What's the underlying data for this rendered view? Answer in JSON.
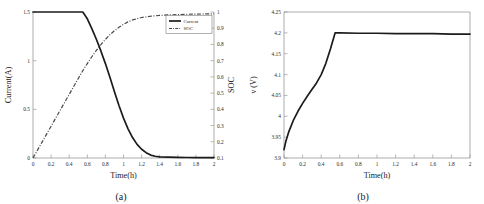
{
  "figure": {
    "panels": [
      {
        "caption": "(a)",
        "name": "current-soc-panel"
      },
      {
        "caption": "(b)",
        "name": "voltage-panel"
      }
    ]
  },
  "chart_data": [
    {
      "type": "line",
      "title": "",
      "panel_label": "(a)",
      "xlabel": "Time(h)",
      "ylabel": "Current(A)",
      "y2label": "SOC",
      "xlim": [
        0,
        2
      ],
      "ylim": [
        0,
        1.5
      ],
      "y2lim": [
        0.1,
        1
      ],
      "xticks": [
        0,
        0.2,
        0.4,
        0.6,
        0.8,
        1,
        1.2,
        1.4,
        1.6,
        1.8,
        2
      ],
      "xticklabels": [
        "0",
        "0.2",
        "0.4",
        "0.6",
        "0.8",
        "1",
        "1.2",
        "1.4",
        "1.6",
        "1.8",
        "2"
      ],
      "yticks": [
        0,
        0.5,
        1,
        1.5
      ],
      "yticklabels": [
        "0",
        "0.5",
        "1",
        "1.5"
      ],
      "y2ticks": [
        0.1,
        0.2,
        0.3,
        0.4,
        0.5,
        0.6,
        0.7,
        0.8,
        0.9,
        1
      ],
      "y2ticklabels": [
        "0.1",
        "0.2",
        "0.3",
        "0.4",
        "0.5",
        "0.6",
        "0.7",
        "0.8",
        "0.9",
        "1"
      ],
      "grid": false,
      "legend": {
        "position": "upper-right-inside",
        "entries": [
          {
            "label": "Current",
            "style": "solid"
          },
          {
            "label": "SOC",
            "style": "dash-dot"
          }
        ]
      },
      "series": [
        {
          "name": "Current",
          "axis": "left",
          "style": "solid",
          "x": [
            0,
            0.1,
            0.2,
            0.3,
            0.4,
            0.5,
            0.55,
            0.6,
            0.65,
            0.7,
            0.75,
            0.8,
            0.85,
            0.9,
            0.95,
            1.0,
            1.05,
            1.1,
            1.15,
            1.2,
            1.25,
            1.3,
            1.35,
            1.4,
            1.5,
            1.6,
            1.7,
            1.8,
            1.9,
            2.0
          ],
          "y": [
            1.5,
            1.5,
            1.5,
            1.5,
            1.5,
            1.5,
            1.5,
            1.43,
            1.33,
            1.22,
            1.1,
            0.97,
            0.83,
            0.68,
            0.54,
            0.41,
            0.3,
            0.21,
            0.14,
            0.09,
            0.055,
            0.03,
            0.018,
            0.012,
            0.008,
            0.006,
            0.005,
            0.004,
            0.004,
            0.004
          ]
        },
        {
          "name": "SOC",
          "axis": "right",
          "style": "dash-dot",
          "x": [
            0,
            0.1,
            0.2,
            0.3,
            0.4,
            0.5,
            0.55,
            0.6,
            0.65,
            0.7,
            0.75,
            0.8,
            0.85,
            0.9,
            0.95,
            1.0,
            1.05,
            1.1,
            1.2,
            1.3,
            1.4,
            1.5,
            1.6,
            1.7,
            1.8,
            1.9,
            2.0
          ],
          "y": [
            0.1,
            0.198,
            0.296,
            0.394,
            0.492,
            0.59,
            0.638,
            0.682,
            0.724,
            0.763,
            0.799,
            0.831,
            0.86,
            0.885,
            0.906,
            0.924,
            0.939,
            0.951,
            0.966,
            0.974,
            0.979,
            0.982,
            0.984,
            0.986,
            0.987,
            0.988,
            0.989
          ]
        }
      ]
    },
    {
      "type": "line",
      "title": "",
      "panel_label": "(b)",
      "xlabel": "Time(h)",
      "ylabel": "v (V)",
      "xlim": [
        0,
        2
      ],
      "ylim": [
        3.9,
        4.25
      ],
      "xticks": [
        0,
        0.2,
        0.4,
        0.6,
        0.8,
        1,
        1.2,
        1.4,
        1.6,
        1.8,
        2
      ],
      "xticklabels": [
        "0",
        "0.2",
        "0.4",
        "0.6",
        "0.8",
        "1",
        "1.2",
        "1.4",
        "1.6",
        "1.8",
        "2"
      ],
      "yticks": [
        3.9,
        3.95,
        4,
        4.05,
        4.1,
        4.15,
        4.2,
        4.25
      ],
      "yticklabels": [
        "3.9",
        "3.95",
        "4",
        "4.05",
        "4.1",
        "4.15",
        "4.2",
        "4.25"
      ],
      "grid": false,
      "legend": null,
      "series": [
        {
          "name": "v",
          "axis": "left",
          "style": "solid",
          "x": [
            0,
            0.02,
            0.05,
            0.1,
            0.15,
            0.2,
            0.25,
            0.3,
            0.35,
            0.4,
            0.45,
            0.5,
            0.55,
            0.6,
            0.8,
            1.0,
            1.2,
            1.4,
            1.6,
            1.8,
            2.0
          ],
          "y": [
            3.92,
            3.94,
            3.962,
            3.99,
            4.012,
            4.031,
            4.048,
            4.064,
            4.08,
            4.1,
            4.127,
            4.162,
            4.2,
            4.2,
            4.199,
            4.199,
            4.198,
            4.198,
            4.198,
            4.197,
            4.197
          ]
        }
      ]
    }
  ]
}
